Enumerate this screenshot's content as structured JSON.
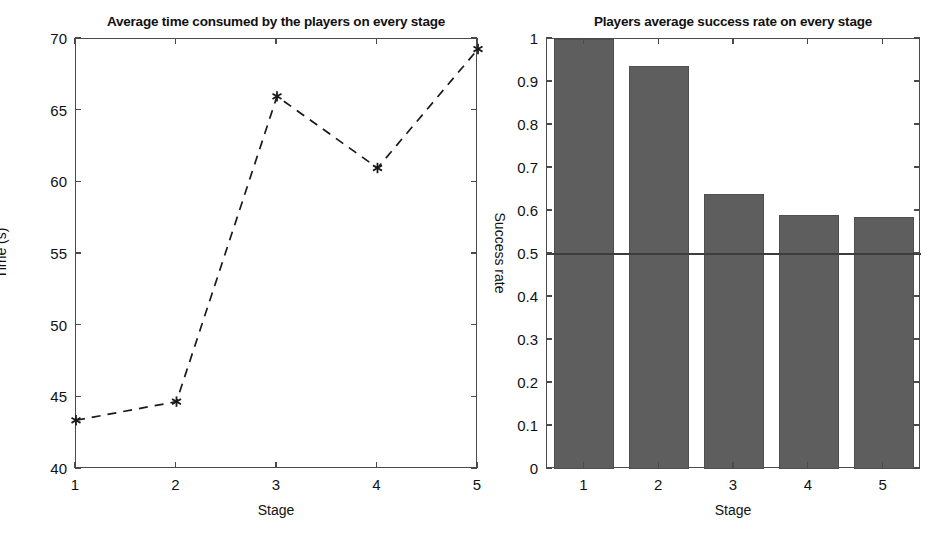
{
  "figure": {
    "width": 948,
    "height": 546,
    "background": "#ffffff",
    "line_color": "#1a1a1a",
    "bar_color": "#5e5e5e",
    "axis_color": "#4a4a4a"
  },
  "chart_data": [
    {
      "type": "line",
      "title": "Average time consumed by the players on every stage",
      "xlabel": "Stage",
      "ylabel": "Time (s)",
      "categories": [
        "1",
        "2",
        "3",
        "4",
        "5"
      ],
      "x": [
        1,
        2,
        3,
        4,
        5
      ],
      "values": [
        43.4,
        44.7,
        66.0,
        61.0,
        69.3
      ],
      "xlim": [
        1,
        5
      ],
      "ylim": [
        40,
        70
      ],
      "xticks": [
        1,
        2,
        3,
        4,
        5
      ],
      "xticklabels": [
        "1",
        "2",
        "3",
        "4",
        "5"
      ],
      "yticks": [
        40,
        45,
        50,
        55,
        60,
        65,
        70
      ],
      "yticklabels": [
        "40",
        "45",
        "50",
        "55",
        "60",
        "65",
        "70"
      ],
      "grid": false,
      "legend": null,
      "linestyle": "dashed",
      "marker": "asterisk",
      "color": "#1a1a1a"
    },
    {
      "type": "bar",
      "title": "Players average success rate on every stage",
      "xlabel": "Stage",
      "ylabel": "Success rate",
      "ylabel_rotation": "clockwise-90",
      "categories": [
        "1",
        "2",
        "3",
        "4",
        "5"
      ],
      "values": [
        1.0,
        0.937,
        0.64,
        0.591,
        0.585
      ],
      "xlim": [
        0.5,
        5.5
      ],
      "ylim": [
        0,
        1
      ],
      "xticks": [
        1,
        2,
        3,
        4,
        5
      ],
      "xticklabels": [
        "1",
        "2",
        "3",
        "4",
        "5"
      ],
      "yticks": [
        0,
        0.1,
        0.2,
        0.3,
        0.4,
        0.5,
        0.6,
        0.7,
        0.8,
        0.9,
        1
      ],
      "yticklabels": [
        "0",
        "0.1",
        "0.2",
        "0.3",
        "0.4",
        "0.5",
        "0.6",
        "0.7",
        "0.8",
        "0.9",
        "1"
      ],
      "grid": false,
      "legend": null,
      "color": "#5e5e5e",
      "reference_line": {
        "y": 0.5,
        "color": "#3d3d3d"
      }
    }
  ]
}
